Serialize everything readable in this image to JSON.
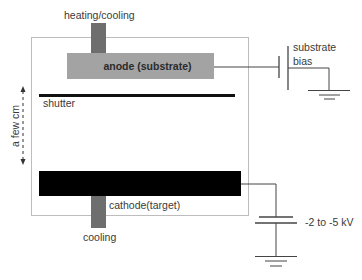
{
  "diagram": {
    "labels": {
      "heating_cooling": "heating/cooling",
      "anode": "anode (substrate)",
      "shutter": "shutter",
      "distance": "a few cm",
      "cathode": "cathode(target)",
      "cooling": "cooling",
      "substrate_bias_line1": "substrate",
      "substrate_bias_line2": "bias",
      "voltage": "-2 to -5 kV"
    },
    "colors": {
      "chamber_border": "#bdbdbd",
      "pedestal": "#6e6e6e",
      "anode": "#a3a3a3",
      "shutter": "#111111",
      "cathode": "#000000",
      "wire": "#444444"
    }
  }
}
